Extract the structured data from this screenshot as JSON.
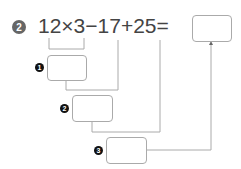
{
  "problem": {
    "number": "2",
    "expression": "12×3−17+25=",
    "answer_value": ""
  },
  "steps": [
    {
      "marker": "1",
      "operation": "12×3",
      "value": ""
    },
    {
      "marker": "2",
      "operation": "step1 − 17",
      "value": ""
    },
    {
      "marker": "3",
      "operation": "step2 + 25",
      "value": ""
    }
  ],
  "colors": {
    "text": "#444444",
    "lines": "#aaaaaa",
    "problem_badge": "#666666",
    "step_badge": "#111111"
  }
}
